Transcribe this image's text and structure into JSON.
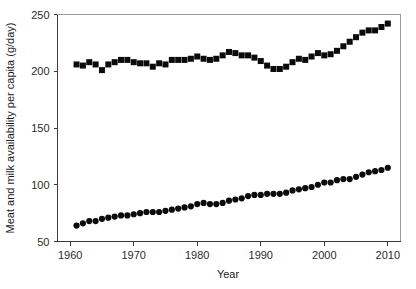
{
  "chart_data": {
    "type": "scatter",
    "title": "",
    "xlabel": "Year",
    "ylabel": "Meat and milk availability per capita (g/day)",
    "xlim": [
      1958,
      2012
    ],
    "ylim": [
      50,
      250
    ],
    "xticks": [
      1960,
      1970,
      1980,
      1990,
      2000,
      2010
    ],
    "yticks": [
      50,
      100,
      150,
      200,
      250
    ],
    "grid": false,
    "legend": "none",
    "x": [
      1961,
      1962,
      1963,
      1964,
      1965,
      1966,
      1967,
      1968,
      1969,
      1970,
      1971,
      1972,
      1973,
      1974,
      1975,
      1976,
      1977,
      1978,
      1979,
      1980,
      1981,
      1982,
      1983,
      1984,
      1985,
      1986,
      1987,
      1988,
      1989,
      1990,
      1991,
      1992,
      1993,
      1994,
      1995,
      1996,
      1997,
      1998,
      1999,
      2000,
      2001,
      2002,
      2003,
      2004,
      2005,
      2006,
      2007,
      2008,
      2009,
      2010
    ],
    "series": [
      {
        "name": "Milk availability per capita",
        "marker": "square",
        "color": "#0b0b0b",
        "values": [
          206,
          205,
          208,
          206,
          201,
          206,
          208,
          210,
          210,
          208,
          207,
          207,
          204,
          207,
          206,
          210,
          210,
          210,
          211,
          213,
          211,
          210,
          211,
          214,
          217,
          216,
          214,
          214,
          212,
          209,
          205,
          202,
          202,
          204,
          208,
          211,
          210,
          213,
          216,
          214,
          215,
          218,
          222,
          226,
          230,
          234,
          236,
          236,
          239,
          242
        ]
      },
      {
        "name": "Meat availability per capita",
        "marker": "circle",
        "color": "#0b0b0b",
        "values": [
          64,
          66,
          68,
          68,
          70,
          71,
          72,
          73,
          73,
          74,
          75,
          76,
          76,
          76,
          77,
          78,
          79,
          80,
          81,
          83,
          84,
          83,
          83,
          84,
          86,
          87,
          88,
          90,
          91,
          91,
          92,
          92,
          92,
          93,
          95,
          96,
          97,
          98,
          100,
          102,
          102,
          104,
          105,
          105,
          107,
          109,
          111,
          112,
          113,
          115
        ]
      }
    ]
  },
  "axes": {
    "x_title": "Year",
    "y_title": "Meat and milk availability per capita (g/day)"
  }
}
